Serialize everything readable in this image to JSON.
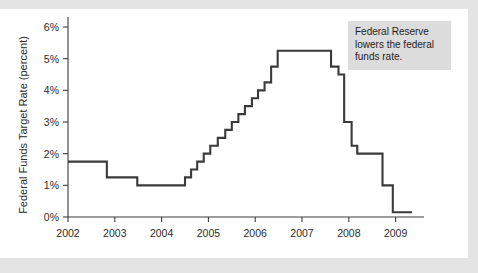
{
  "annotation": {
    "text": "Federal Reserve lowers the federal funds rate."
  },
  "colors": {
    "line": "#3a3a3a",
    "axis": "#3c3c3c",
    "annotation_background": "#dcdcdc",
    "card_background": "#ffffff",
    "page_background": "#e4e4e4"
  },
  "chart_data": {
    "type": "line",
    "title": "",
    "xlabel": "",
    "ylabel": "Federal Funds Target Rate (percent)",
    "xlim": [
      2002.0,
      2009.35
    ],
    "ylim": [
      0,
      6
    ],
    "grid": false,
    "legend": false,
    "x_tick_labels": [
      "2002",
      "2003",
      "2004",
      "2005",
      "2006",
      "2007",
      "2008",
      "2009"
    ],
    "x_ticks": [
      2002,
      2003,
      2004,
      2005,
      2006,
      2007,
      2008,
      2009
    ],
    "y_tick_labels": [
      "0%",
      "1%",
      "2%",
      "3%",
      "4%",
      "5%",
      "6%"
    ],
    "y_ticks": [
      0,
      1,
      2,
      3,
      4,
      5,
      6
    ],
    "step_style": "post",
    "annotations": [
      {
        "text": "Federal Reserve lowers the federal funds rate.",
        "x": 2007.6,
        "y": 5.6
      }
    ],
    "series": [
      {
        "name": "Federal Funds Target Rate",
        "x": [
          2002.0,
          2002.83,
          2002.83,
          2003.48,
          2003.48,
          2004.5,
          2004.5,
          2004.63,
          2004.63,
          2004.76,
          2004.76,
          2004.9,
          2004.9,
          2005.04,
          2005.04,
          2005.2,
          2005.2,
          2005.36,
          2005.36,
          2005.5,
          2005.5,
          2005.64,
          2005.64,
          2005.78,
          2005.78,
          2005.93,
          2005.93,
          2006.06,
          2006.06,
          2006.2,
          2006.2,
          2006.34,
          2006.34,
          2006.48,
          2006.48,
          2007.62,
          2007.62,
          2007.78,
          2007.78,
          2007.9,
          2007.9,
          2008.06,
          2008.06,
          2008.18,
          2008.18,
          2008.32,
          2008.32,
          2008.72,
          2008.72,
          2008.94,
          2008.94,
          2009.35
        ],
        "y": [
          1.75,
          1.75,
          1.25,
          1.25,
          1.0,
          1.0,
          1.25,
          1.25,
          1.5,
          1.5,
          1.75,
          1.75,
          2.0,
          2.0,
          2.25,
          2.25,
          2.5,
          2.5,
          2.75,
          2.75,
          3.0,
          3.0,
          3.25,
          3.25,
          3.5,
          3.5,
          3.75,
          3.75,
          4.0,
          4.0,
          4.25,
          4.25,
          4.75,
          4.75,
          5.25,
          5.25,
          4.75,
          4.75,
          4.5,
          4.5,
          3.0,
          3.0,
          2.25,
          2.25,
          2.0,
          2.0,
          2.0,
          2.0,
          1.0,
          1.0,
          0.15,
          0.15
        ]
      }
    ],
    "events": [
      {
        "date": "2002",
        "rate": 1.75
      },
      {
        "date": "late 2002",
        "rate": 1.25
      },
      {
        "date": "mid 2003",
        "rate": 1.0
      },
      {
        "date": "mid 2004",
        "rate": 1.25
      },
      {
        "date": "mid 2006 - mid 2007",
        "rate": 5.25
      },
      {
        "date": "late 2007",
        "rate": 4.5
      },
      {
        "date": "early 2008",
        "rate": 3.0
      },
      {
        "date": "mid 2008",
        "rate": 2.0
      },
      {
        "date": "late 2008",
        "rate": 1.0
      },
      {
        "date": "end 2008 - 2009",
        "rate": 0.15
      }
    ]
  }
}
